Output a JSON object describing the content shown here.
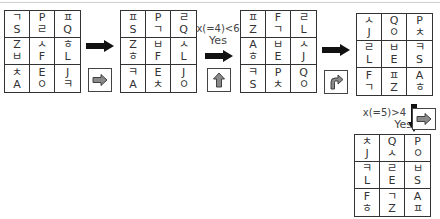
{
  "grids": [
    {
      "id": "grid-1",
      "cells": [
        [
          "ㄱ",
          "S"
        ],
        [
          "P",
          "ㄹ"
        ],
        [
          "ㅍ",
          "Q"
        ],
        [
          "Z",
          "ㅂ"
        ],
        [
          "ㅅ",
          "F"
        ],
        [
          "ㅎ",
          "L"
        ],
        [
          "ㅊ",
          "A"
        ],
        [
          "E",
          "ㅇ"
        ],
        [
          "J",
          "ㅋ"
        ]
      ]
    },
    {
      "id": "grid-2",
      "cells": [
        [
          "ㅍ",
          "S"
        ],
        [
          "P",
          "ㄱ"
        ],
        [
          "ㄹ",
          "Q"
        ],
        [
          "Z",
          "ㅎ"
        ],
        [
          "ㅂ",
          "F"
        ],
        [
          "ㅅ",
          "L"
        ],
        [
          "ㅋ",
          "A"
        ],
        [
          "E",
          "ㅊ"
        ],
        [
          "J",
          "ㅇ"
        ]
      ]
    },
    {
      "id": "grid-3",
      "cells": [
        [
          "ㅍ",
          "Z"
        ],
        [
          "F",
          "ㄱ"
        ],
        [
          "ㄹ",
          "L"
        ],
        [
          "A",
          "ㅎ"
        ],
        [
          "ㅂ",
          "E"
        ],
        [
          "ㅅ",
          "J"
        ],
        [
          "ㅋ",
          "S"
        ],
        [
          "P",
          "ㅊ"
        ],
        [
          "Q",
          "ㅇ"
        ]
      ]
    },
    {
      "id": "grid-4",
      "cells": [
        [
          "ㅅ",
          "J"
        ],
        [
          "Q",
          "ㅇ"
        ],
        [
          "P",
          "ㅊ"
        ],
        [
          "ㄹ",
          "L"
        ],
        [
          "ㅂ",
          "E"
        ],
        [
          "ㅋ",
          "S"
        ],
        [
          "F",
          "ㄱ"
        ],
        [
          "ㅍ",
          "Z"
        ],
        [
          "A",
          "ㅎ"
        ]
      ]
    },
    {
      "id": "grid-5",
      "cells": [
        [
          "ㅊ",
          "J"
        ],
        [
          "Q",
          "ㅅ"
        ],
        [
          "P",
          "ㅇ"
        ],
        [
          "ㅋ",
          "L"
        ],
        [
          "ㄹ",
          "E"
        ],
        [
          "ㅂ",
          "S"
        ],
        [
          "F",
          "ㅎ"
        ],
        [
          "ㄱ",
          "Z"
        ],
        [
          "A",
          "ㅍ"
        ]
      ]
    }
  ],
  "conditions": {
    "c1_expr": "x(=4)<6",
    "c1_result": "Yes",
    "c2_expr": "x(=5)>4",
    "c2_result": "Yes"
  },
  "operation_icons": [
    {
      "name": "right-arrow-operation",
      "glyph": "right-arrow"
    },
    {
      "name": "up-arrow-operation",
      "glyph": "up-arrow"
    },
    {
      "name": "turn-right-operation",
      "glyph": "turn-right-arrow"
    },
    {
      "name": "right-arrow-operation-2",
      "glyph": "right-arrow"
    }
  ],
  "colors": {
    "border": "#333333",
    "arrow": "#111111",
    "icon_fill": "#8a8a8a"
  }
}
